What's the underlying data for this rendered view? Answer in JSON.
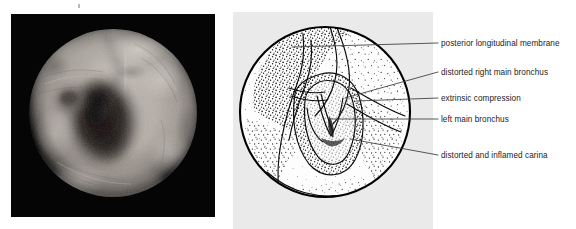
{
  "figure": {
    "type": "medical-illustration-pair",
    "caption": "",
    "panels": [
      {
        "id": "photograph",
        "kind": "endoscopic-photograph",
        "description": "black-and-white bronchoscopic view of the distal trachea and carina",
        "background_color": "#050505",
        "tint": "grayscale"
      },
      {
        "id": "line-diagram",
        "kind": "labelled-line-drawing",
        "description": "stippled line drawing of the same bronchoscopic view with leader lines",
        "background_color": "#eaeaea",
        "outline_color": "#000000"
      }
    ]
  },
  "diagram": {
    "circle": {
      "cx": 92,
      "cy": 100,
      "r": 86
    },
    "labels": [
      {
        "id": "posterior-longitudinal-membrane",
        "text": "posterior longitudinal membrane",
        "leader_end_x": 438,
        "leader_end_y": 43,
        "target_x": 292,
        "target_y": 46
      },
      {
        "id": "distorted-right-main-bronchus",
        "text": "distorted right main bronchus",
        "leader_end_x": 438,
        "leader_end_y": 72,
        "target_x": 344,
        "target_y": 97
      },
      {
        "id": "extrinsic-compression",
        "text": "extrinsic compression",
        "leader_end_x": 438,
        "leader_end_y": 98,
        "target_x": 355,
        "target_y": 101
      },
      {
        "id": "left-main-bronchus",
        "text": "left main bronchus",
        "leader_end_x": 438,
        "leader_end_y": 119,
        "target_x": 330,
        "target_y": 119
      },
      {
        "id": "distorted-and-inflamed-carina",
        "text": "distorted and inflamed carina",
        "leader_end_x": 438,
        "leader_end_y": 155,
        "target_x": 350,
        "target_y": 139
      }
    ]
  },
  "colors": {
    "page_background": "#ffffff",
    "photo_background": "#050505",
    "diagram_background": "#eaeaea",
    "ink": "#000000",
    "label_text": "#1d1d1d",
    "leader_line": "#3a3a3a"
  }
}
